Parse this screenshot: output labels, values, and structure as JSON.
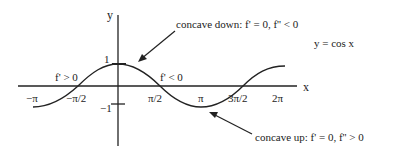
{
  "title": "y = cos x",
  "axes": {
    "x_label": "x",
    "y_label": "y",
    "x_ticks": [
      "−π",
      "−π/2",
      "π/2",
      "π",
      "3π/2",
      "2π"
    ],
    "y_ticks": [
      "1",
      "−1"
    ]
  },
  "annotations": {
    "increasing": "f' > 0",
    "decreasing": "f' < 0",
    "concave_down": "concave down: f' = 0, f'' < 0",
    "concave_up": "concave up: f' = 0, f'' > 0"
  },
  "colors": {
    "line": "#222222",
    "background": "#ffffff"
  }
}
